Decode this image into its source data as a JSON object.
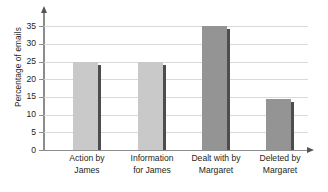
{
  "chart_data": {
    "type": "bar",
    "title": "",
    "subtitle": "",
    "xlabel": "",
    "ylabel": "Percentage of emails",
    "categories": [
      "Action by James",
      "Information for James",
      "Dealt with by Margaret",
      "Deleted by Margaret"
    ],
    "category_lines": [
      [
        "Action by",
        "James"
      ],
      [
        "Information",
        "for James"
      ],
      [
        "Dealt with by",
        "Margaret"
      ],
      [
        "Deleted by",
        "Margaret"
      ]
    ],
    "values": [
      25,
      25,
      35,
      14.5
    ],
    "ylim": [
      0,
      37
    ],
    "yticks": [
      0,
      5,
      10,
      15,
      20,
      25,
      30,
      35
    ],
    "ytick_labels": [
      "0",
      "5",
      "10",
      "15",
      "20",
      "25",
      "30",
      "35"
    ],
    "grid": true,
    "legend": "none",
    "bar_colors": [
      "#c9c9c9",
      "#c9c9c9",
      "#949494",
      "#949494"
    ],
    "bar_shadow_color": "#4d4d4d",
    "gridline_color": "#d9d9d9",
    "axis_color": "#8c8c8c",
    "text_color": "#231f20",
    "background": "#ffffff"
  }
}
